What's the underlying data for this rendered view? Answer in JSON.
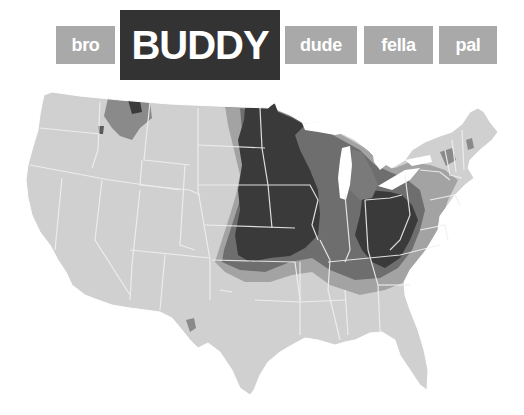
{
  "tabs": [
    {
      "id": "bro",
      "label": "bro",
      "active": false
    },
    {
      "id": "buddy",
      "label": "BUDDY",
      "active": true
    },
    {
      "id": "dude",
      "label": "dude",
      "active": false
    },
    {
      "id": "fella",
      "label": "fella",
      "active": false
    },
    {
      "id": "pal",
      "label": "pal",
      "active": false
    }
  ],
  "map": {
    "subject": "Usage of the term \"buddy\" by US county",
    "shades": {
      "lowest": "#d0d0d0",
      "low": "#a3a3a3",
      "medium": "#6e6e6e",
      "highest": "#3a3a3a"
    },
    "border_color": "#f2f2f2",
    "regions": [
      {
        "name": "Upper Midwest / Great Plains core",
        "shade": "highest"
      },
      {
        "name": "Ohio / West Virginia / Eastern Kentucky core",
        "shade": "highest"
      },
      {
        "name": "Northern Montana / Idaho panhandle",
        "shade": "medium"
      },
      {
        "name": "Great Lakes / Appalachia fringe",
        "shade": "medium"
      },
      {
        "name": "West, South, Northeast",
        "shade": "lowest"
      }
    ]
  }
}
